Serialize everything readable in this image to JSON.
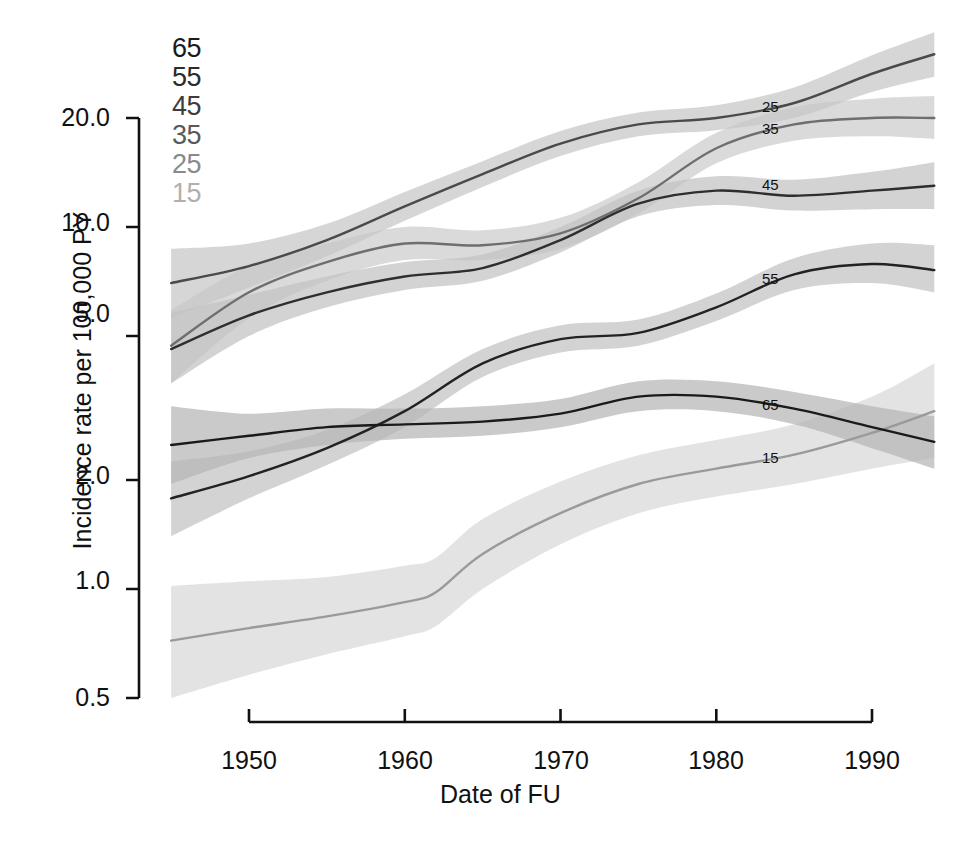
{
  "chart_data": {
    "type": "line",
    "title": "",
    "xlabel": "Date of FU",
    "ylabel": "Incidence rate per 100,000 PY",
    "yscale": "log",
    "ylim": [
      0.5,
      20.0
    ],
    "xlim": [
      1945,
      1994
    ],
    "grid": false,
    "yticks": [
      "0.5",
      "1.0",
      "2.0",
      "5.0",
      "10.0",
      "20.0"
    ],
    "ytick_values": [
      0.5,
      1.0,
      2.0,
      5.0,
      10.0,
      20.0
    ],
    "xticks": [
      "1950",
      "1960",
      "1970",
      "1980",
      "1990"
    ],
    "xtick_values": [
      1950,
      1960,
      1970,
      1980,
      1990
    ],
    "legend_position": "top-left-inside",
    "legend_entries": [
      {
        "label": "65",
        "color": "#1a1a1a"
      },
      {
        "label": "55",
        "color": "#333333"
      },
      {
        "label": "45",
        "color": "#4d4d4d"
      },
      {
        "label": "35",
        "color": "#666666"
      },
      {
        "label": "25",
        "color": "#8f8f8f"
      },
      {
        "label": "15",
        "color": "#b3b3b3"
      }
    ],
    "band_note": "shaded ribbons are pointwise confidence bands around each fitted curve",
    "series": [
      {
        "name": "15",
        "label": "15",
        "color": "#9a9a9a",
        "band_color": "#d8d8d8",
        "x": [
          1945,
          1950,
          1955,
          1960,
          1962,
          1965,
          1970,
          1975,
          1980,
          1985,
          1990,
          1994
        ],
        "values": [
          0.72,
          0.78,
          0.84,
          0.92,
          0.98,
          1.25,
          1.62,
          1.95,
          2.15,
          2.35,
          2.7,
          3.1
        ],
        "lower": [
          0.5,
          0.58,
          0.66,
          0.74,
          0.79,
          1.0,
          1.33,
          1.62,
          1.8,
          1.95,
          2.15,
          2.3
        ],
        "upper": [
          1.02,
          1.05,
          1.08,
          1.16,
          1.22,
          1.56,
          1.98,
          2.34,
          2.58,
          2.85,
          3.4,
          4.2
        ]
      },
      {
        "name": "25",
        "label": "25",
        "color": "#6e6e6e",
        "band_color": "#cccccc",
        "x": [
          1945,
          1950,
          1955,
          1960,
          1965,
          1970,
          1975,
          1980,
          1985,
          1990,
          1994
        ],
        "values": [
          4.7,
          6.6,
          8.0,
          9.0,
          8.9,
          9.6,
          12.0,
          16.5,
          19.2,
          20.0,
          20.0
        ],
        "lower": [
          3.7,
          5.6,
          7.1,
          8.1,
          8.1,
          8.7,
          10.9,
          15.0,
          17.3,
          17.8,
          17.5
        ],
        "upper": [
          5.9,
          7.8,
          9.0,
          10.0,
          9.8,
          10.6,
          13.3,
          18.2,
          21.4,
          22.6,
          23.0
        ]
      },
      {
        "name": "35",
        "label": "35",
        "color": "#4a4a4a",
        "band_color": "#c6c6c6",
        "x": [
          1945,
          1950,
          1955,
          1960,
          1965,
          1970,
          1975,
          1980,
          1985,
          1990,
          1994
        ],
        "values": [
          7.0,
          7.8,
          9.2,
          11.4,
          14.0,
          17.0,
          19.2,
          20.0,
          22.0,
          26.5,
          30.0
        ],
        "lower": [
          5.6,
          6.8,
          8.3,
          10.4,
          12.9,
          15.7,
          17.8,
          18.5,
          20.0,
          23.6,
          26.0
        ],
        "upper": [
          8.7,
          9.0,
          10.2,
          12.5,
          15.2,
          18.4,
          20.7,
          21.7,
          24.3,
          29.8,
          34.5
        ]
      },
      {
        "name": "45",
        "label": "45",
        "color": "#2e2e2e",
        "band_color": "#c2c2c2",
        "x": [
          1945,
          1950,
          1955,
          1960,
          1965,
          1970,
          1975,
          1980,
          1985,
          1990,
          1994
        ],
        "values": [
          4.6,
          5.7,
          6.6,
          7.3,
          7.7,
          9.2,
          11.6,
          12.6,
          12.2,
          12.6,
          13.0
        ],
        "lower": [
          3.7,
          5.0,
          6.0,
          6.7,
          7.1,
          8.5,
          10.7,
          11.5,
          11.1,
          11.2,
          11.2
        ],
        "upper": [
          5.8,
          6.5,
          7.3,
          8.0,
          8.4,
          10.0,
          12.6,
          13.8,
          13.5,
          14.2,
          15.1
        ]
      },
      {
        "name": "55",
        "label": "55",
        "color": "#222222",
        "band_color": "#c2c2c2",
        "x": [
          1945,
          1950,
          1955,
          1960,
          1965,
          1970,
          1975,
          1980,
          1985,
          1990,
          1994
        ],
        "values": [
          1.78,
          2.05,
          2.45,
          3.1,
          4.2,
          4.9,
          5.1,
          6.0,
          7.4,
          7.9,
          7.6
        ],
        "lower": [
          1.4,
          1.78,
          2.2,
          2.8,
          3.85,
          4.5,
          4.7,
          5.5,
          6.7,
          7.0,
          6.6
        ],
        "upper": [
          2.25,
          2.4,
          2.75,
          3.45,
          4.6,
          5.35,
          5.55,
          6.55,
          8.2,
          9.0,
          8.9
        ]
      },
      {
        "name": "65",
        "label": "65",
        "color": "#1a1a1a",
        "band_color": "#b5b5b5",
        "x": [
          1945,
          1950,
          1955,
          1960,
          1965,
          1970,
          1975,
          1980,
          1985,
          1990,
          1994
        ],
        "values": [
          2.5,
          2.65,
          2.8,
          2.85,
          2.9,
          3.05,
          3.4,
          3.4,
          3.15,
          2.8,
          2.55
        ],
        "lower": [
          1.95,
          2.3,
          2.5,
          2.6,
          2.65,
          2.8,
          3.1,
          3.1,
          2.85,
          2.45,
          2.15
        ],
        "upper": [
          3.2,
          3.05,
          3.15,
          3.15,
          3.2,
          3.35,
          3.75,
          3.75,
          3.5,
          3.2,
          3.0
        ]
      }
    ],
    "inline_labels": [
      {
        "text": "25",
        "x": 1984,
        "y_px": 108
      },
      {
        "text": "35",
        "x": 1984,
        "y_px": 130
      },
      {
        "text": "45",
        "x": 1984,
        "y_px": 186
      },
      {
        "text": "55",
        "x": 1984,
        "y_px": 280
      },
      {
        "text": "65",
        "x": 1984,
        "y_px": 406
      },
      {
        "text": "15",
        "x": 1984,
        "y_px": 459
      }
    ]
  },
  "axes": {
    "ylabel": "Incidence rate per 100,000 PY",
    "xlabel": "Date of FU",
    "yticks": [
      "20.0",
      "10.0",
      "5.0",
      "2.0",
      "1.0",
      "0.5"
    ],
    "xticks": [
      "1950",
      "1960",
      "1970",
      "1980",
      "1990"
    ]
  },
  "legend": {
    "items": [
      "65",
      "55",
      "45",
      "35",
      "25",
      "15"
    ]
  }
}
